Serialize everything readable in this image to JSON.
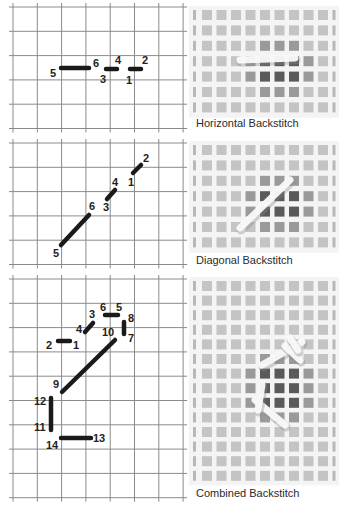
{
  "panels": [
    {
      "id": "horizontal",
      "caption": "Horizontal Backstitch",
      "grid": {
        "x0": 13,
        "y0": 7,
        "cols": 7,
        "rows": 5,
        "pitch": 24.3
      },
      "stitches": [
        {
          "from": "5",
          "to": "6",
          "x1": 61,
          "y1": 68,
          "x2": 89,
          "y2": 68
        },
        {
          "from": "3",
          "to": "4",
          "x1": 106,
          "y1": 69,
          "x2": 117,
          "y2": 69
        },
        {
          "from": "1",
          "to": "2",
          "x1": 130,
          "y1": 69,
          "x2": 141,
          "y2": 69
        }
      ],
      "labels": [
        {
          "text": "5",
          "x": 50,
          "y": 77
        },
        {
          "text": "6",
          "x": 93,
          "y": 67
        },
        {
          "text": "3",
          "x": 100,
          "y": 83
        },
        {
          "text": "4",
          "x": 115,
          "y": 64
        },
        {
          "text": "1",
          "x": 126,
          "y": 84
        },
        {
          "text": "2",
          "x": 142,
          "y": 64
        }
      ],
      "swatch": {
        "x": 193,
        "y": 10,
        "cols": 10,
        "rows": 7,
        "pitch": 15.4
      },
      "caption_y": 117
    },
    {
      "id": "diagonal",
      "caption": "Diagonal Backstitch",
      "grid": {
        "x0": 13,
        "y0": 143,
        "cols": 7,
        "rows": 5,
        "pitch": 24.3
      },
      "stitches": [
        {
          "from": "1",
          "to": "2",
          "x1": 133,
          "y1": 173,
          "x2": 141,
          "y2": 165
        },
        {
          "from": "3",
          "to": "4",
          "x1": 107,
          "y1": 199,
          "x2": 115,
          "y2": 190
        },
        {
          "from": "5",
          "to": "6",
          "x1": 61,
          "y1": 245,
          "x2": 89,
          "y2": 215
        }
      ],
      "labels": [
        {
          "text": "2",
          "x": 143,
          "y": 162
        },
        {
          "text": "1",
          "x": 128,
          "y": 186
        },
        {
          "text": "4",
          "x": 112,
          "y": 186
        },
        {
          "text": "3",
          "x": 103,
          "y": 211
        },
        {
          "text": "6",
          "x": 89,
          "y": 210
        },
        {
          "text": "5",
          "x": 53,
          "y": 257
        }
      ],
      "swatch": {
        "x": 193,
        "y": 145,
        "cols": 10,
        "rows": 7,
        "pitch": 15.4
      },
      "caption_y": 254
    },
    {
      "id": "combined",
      "caption": "Combined Backstitch",
      "grid": {
        "x0": 13,
        "y0": 279,
        "cols": 7,
        "rows": 9,
        "pitch": 24.3
      },
      "stitches": [
        {
          "from": "2",
          "to": "1",
          "x1": 58,
          "y1": 341,
          "x2": 70,
          "y2": 341
        },
        {
          "from": "4",
          "to": "3",
          "x1": 85,
          "y1": 332,
          "x2": 93,
          "y2": 323
        },
        {
          "from": "6",
          "to": "5",
          "x1": 105,
          "y1": 315,
          "x2": 118,
          "y2": 315
        },
        {
          "from": "8",
          "to": "7",
          "x1": 124,
          "y1": 322,
          "x2": 124,
          "y2": 334
        },
        {
          "from": "10",
          "to": "9",
          "x1": 115,
          "y1": 340,
          "x2": 62,
          "y2": 392
        },
        {
          "from": "12",
          "to": "11",
          "x1": 51,
          "y1": 398,
          "x2": 51,
          "y2": 430
        },
        {
          "from": "14",
          "to": "13",
          "x1": 61,
          "y1": 438,
          "x2": 91,
          "y2": 438
        }
      ],
      "labels": [
        {
          "text": "2",
          "x": 46,
          "y": 349
        },
        {
          "text": "1",
          "x": 73,
          "y": 349
        },
        {
          "text": "4",
          "x": 76,
          "y": 333
        },
        {
          "text": "3",
          "x": 89,
          "y": 318
        },
        {
          "text": "6",
          "x": 100,
          "y": 311
        },
        {
          "text": "5",
          "x": 116,
          "y": 311
        },
        {
          "text": "8",
          "x": 128,
          "y": 322
        },
        {
          "text": "10",
          "x": 102,
          "y": 336
        },
        {
          "text": "7",
          "x": 128,
          "y": 342
        },
        {
          "text": "9",
          "x": 53,
          "y": 388
        },
        {
          "text": "12",
          "x": 34,
          "y": 405
        },
        {
          "text": "11",
          "x": 34,
          "y": 431
        },
        {
          "text": "14",
          "x": 46,
          "y": 449
        },
        {
          "text": "13",
          "x": 93,
          "y": 442
        }
      ],
      "swatch": {
        "x": 193,
        "y": 281,
        "cols": 10,
        "rows": 14,
        "pitch": 14.6
      },
      "caption_y": 487
    }
  ],
  "colors": {
    "grid_line": "#8a8a8a",
    "stitch": "#1a1a1a",
    "canvas_square": "#c4c4c4",
    "canvas_dark": "#2a2a2a",
    "thread": "#eeeeee",
    "caption": "#2a2a2a"
  }
}
